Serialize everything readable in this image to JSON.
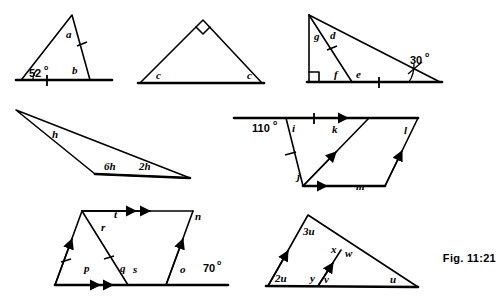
{
  "figure": {
    "caption": "Fig. 11:21",
    "background": "#ffffff",
    "ink": "#000000"
  },
  "panels": [
    {
      "id": "panel-1",
      "name": "scalene-triangle-52deg",
      "labels": [
        {
          "key": "a",
          "text": "a",
          "kind": "italic",
          "x": 66,
          "y": 38
        },
        {
          "key": "b",
          "text": "b",
          "kind": "italic",
          "x": 72,
          "y": 74
        },
        {
          "key": "angle52",
          "text": "52",
          "sup": "o",
          "kind": "angle",
          "x": 29,
          "y": 77
        }
      ]
    },
    {
      "id": "panel-2",
      "name": "right-angled-isosceles-triangle",
      "labels": [
        {
          "key": "c-left",
          "text": "c",
          "kind": "italic",
          "x": 156,
          "y": 79
        },
        {
          "key": "c-right",
          "text": "c",
          "kind": "italic",
          "x": 247,
          "y": 79
        }
      ]
    },
    {
      "id": "panel-3",
      "name": "right-triangle-with-cevian-30deg",
      "labels": [
        {
          "key": "g",
          "text": "g",
          "kind": "italic",
          "x": 314,
          "y": 40
        },
        {
          "key": "d",
          "text": "d",
          "kind": "italic",
          "x": 330,
          "y": 39
        },
        {
          "key": "f",
          "text": "f",
          "kind": "italic",
          "x": 334,
          "y": 78
        },
        {
          "key": "e",
          "text": "e",
          "kind": "italic",
          "x": 356,
          "y": 78
        },
        {
          "key": "angle30",
          "text": "30",
          "sup": "o",
          "kind": "angle",
          "x": 410,
          "y": 64
        }
      ]
    },
    {
      "id": "panel-4",
      "name": "thin-obtuse-triangle",
      "labels": [
        {
          "key": "h",
          "text": "h",
          "kind": "italic",
          "x": 52,
          "y": 138
        },
        {
          "key": "6h",
          "text": "6h",
          "kind": "italic",
          "x": 104,
          "y": 170
        },
        {
          "key": "2h",
          "text": "2h",
          "kind": "italic",
          "x": 139,
          "y": 170
        }
      ]
    },
    {
      "id": "panel-5",
      "name": "parallel-lines-transversals-110deg",
      "labels": [
        {
          "key": "angle110",
          "text": "110",
          "sup": "o",
          "kind": "angle",
          "x": 252,
          "y": 132
        },
        {
          "key": "i",
          "text": "i",
          "kind": "italic",
          "x": 292,
          "y": 132
        },
        {
          "key": "k",
          "text": "k",
          "kind": "italic",
          "x": 332,
          "y": 133
        },
        {
          "key": "l",
          "text": "l",
          "kind": "italic",
          "x": 404,
          "y": 134
        },
        {
          "key": "j",
          "text": "j",
          "kind": "italic",
          "x": 297,
          "y": 180
        },
        {
          "key": "m",
          "text": "m",
          "kind": "italic",
          "x": 356,
          "y": 190
        }
      ]
    },
    {
      "id": "panel-6",
      "name": "parallelogram-angles-70deg",
      "labels": [
        {
          "key": "t",
          "text": "t",
          "kind": "italic",
          "x": 114,
          "y": 218
        },
        {
          "key": "n",
          "text": "n",
          "kind": "italic",
          "x": 195,
          "y": 220
        },
        {
          "key": "r",
          "text": "r",
          "kind": "italic",
          "x": 101,
          "y": 231
        },
        {
          "key": "p",
          "text": "p",
          "kind": "italic",
          "x": 84,
          "y": 272
        },
        {
          "key": "q",
          "text": "q",
          "kind": "italic",
          "x": 120,
          "y": 272
        },
        {
          "key": "s",
          "text": "s",
          "kind": "italic",
          "x": 133,
          "y": 273
        },
        {
          "key": "o",
          "text": "o",
          "kind": "italic",
          "x": 180,
          "y": 273
        },
        {
          "key": "angle70",
          "text": "70",
          "sup": "o",
          "kind": "angle",
          "x": 203,
          "y": 272
        }
      ]
    },
    {
      "id": "panel-7",
      "name": "triangle-with-parallel-segment-u",
      "labels": [
        {
          "key": "3u",
          "text": "3u",
          "kind": "italic",
          "x": 303,
          "y": 235
        },
        {
          "key": "2u",
          "text": "2u",
          "kind": "italic",
          "x": 275,
          "y": 282
        },
        {
          "key": "x",
          "text": "x",
          "kind": "italic",
          "x": 331,
          "y": 253
        },
        {
          "key": "w",
          "text": "w",
          "kind": "italic",
          "x": 345,
          "y": 257
        },
        {
          "key": "y",
          "text": "y",
          "kind": "italic",
          "x": 310,
          "y": 282
        },
        {
          "key": "v",
          "text": "v",
          "kind": "italic",
          "x": 324,
          "y": 283
        },
        {
          "key": "u",
          "text": "u",
          "kind": "italic",
          "x": 390,
          "y": 283
        }
      ]
    }
  ]
}
